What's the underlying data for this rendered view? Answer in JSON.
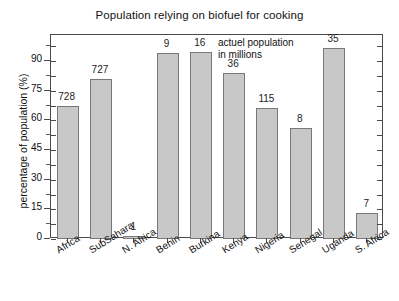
{
  "chart_data": {
    "type": "bar",
    "title": "Population relying on biofuel for cooking",
    "xlabel": "",
    "ylabel": "percentage of population (%)",
    "ylim": [
      0,
      100
    ],
    "yticks": [
      0,
      15,
      30,
      45,
      60,
      75,
      90
    ],
    "grid": false,
    "legend": null,
    "categories": [
      "Africa",
      "SubSahara",
      "N. Africa",
      "Benin",
      "Burkina",
      "Kenya",
      "Nigeria",
      "Senegal",
      "Uganda",
      "S. Africa"
    ],
    "values": [
      67,
      81,
      1.5,
      94,
      94.5,
      84,
      66,
      56,
      96.5,
      13
    ],
    "point_labels": [
      "728",
      "727",
      "1",
      "9",
      "16",
      "36",
      "115",
      "8",
      "35",
      "7"
    ],
    "annotations": [
      {
        "text_line1": "actuel population",
        "text_line2": "in millions"
      }
    ],
    "series": [
      {
        "name": "percentage of population relying on biofuel",
        "values": [
          67,
          81,
          1.5,
          94,
          94.5,
          84,
          66,
          56,
          96.5,
          13
        ]
      }
    ],
    "colors": {
      "bar_fill": "#c8c8c8",
      "bar_stroke": "#787878",
      "axis": "#4a4a4a",
      "text": "#111111",
      "background": "#ffffff"
    }
  }
}
